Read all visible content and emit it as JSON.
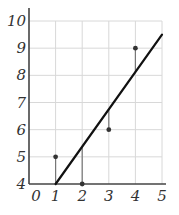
{
  "chart_data": {
    "type": "scatter",
    "title": "",
    "xlabel": "",
    "ylabel": "",
    "xlim": [
      0,
      5
    ],
    "ylim": [
      4,
      10
    ],
    "grid": true,
    "x_ticks": [
      "0",
      "1",
      "2",
      "3",
      "4",
      "5"
    ],
    "y_ticks": [
      "4",
      "5",
      "6",
      "7",
      "8",
      "9",
      "10"
    ],
    "points": [
      {
        "x": 1,
        "y": 5
      },
      {
        "x": 2,
        "y": 4
      },
      {
        "x": 3,
        "y": 6
      },
      {
        "x": 4,
        "y": 9
      }
    ],
    "fit_line": {
      "x0": 1,
      "y0": 4,
      "x1": 5,
      "y1": 9.5
    },
    "residual_lines": true,
    "colors": {
      "axis": "#444444",
      "grid": "#d8d8d8",
      "line": "#111111",
      "point": "#333333",
      "residual": "#777777"
    }
  }
}
